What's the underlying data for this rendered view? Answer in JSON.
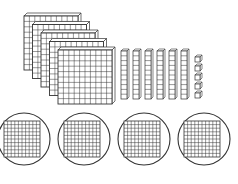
{
  "figure": {
    "stroke_color": "#333333",
    "background": "#ffffff"
  },
  "blocks": {
    "hundreds_flats": {
      "count": 5,
      "grid": 10
    },
    "tens_rods": {
      "count": 6,
      "units_per_rod": 10
    },
    "ones_cubes": {
      "count": 5
    }
  },
  "circled_groups": {
    "count": 4,
    "content": "hundred flat (10x10 grid)"
  }
}
